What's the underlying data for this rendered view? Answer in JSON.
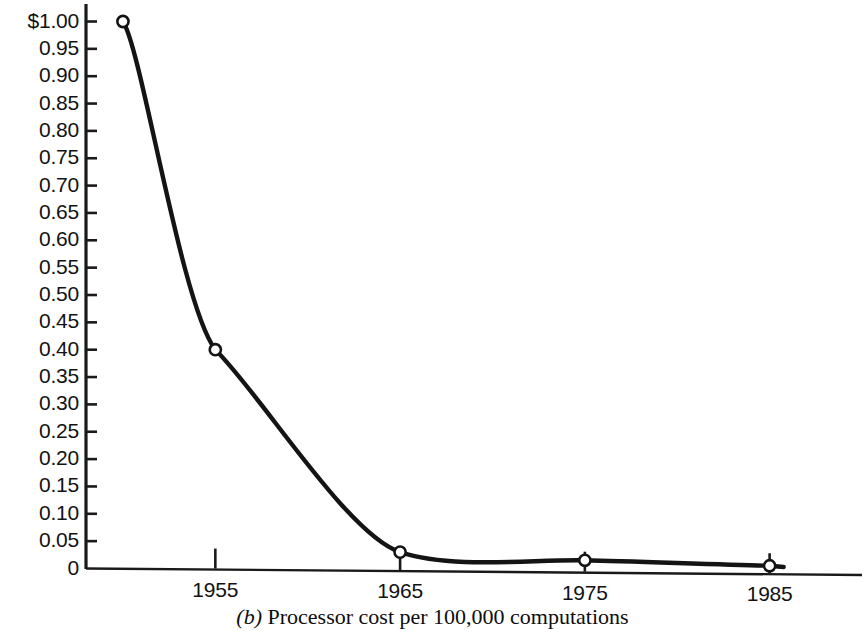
{
  "caption": {
    "letter": "(b)",
    "text": "Processor cost per 100,000 computations",
    "full": "(b) Processor cost per 100,000 computations"
  },
  "colors": {
    "line": "#141414",
    "axis": "#1a1a1a",
    "marker_fill": "#ffffff",
    "marker_stroke": "#141414",
    "background": "#ffffff",
    "text": "#121212"
  },
  "chart_data": {
    "type": "line",
    "title": "",
    "subtitle": "",
    "xlabel": "",
    "ylabel": "",
    "x": [
      1950,
      1955,
      1965,
      1975,
      1985
    ],
    "values": [
      1.0,
      0.4,
      0.03,
      0.015,
      0.005
    ],
    "series": [
      {
        "name": "Processor cost per 100,000 computations",
        "values": [
          1.0,
          0.4,
          0.03,
          0.015,
          0.005
        ]
      }
    ],
    "xlim": [
      1948,
      1990
    ],
    "ylim": [
      0,
      1.0
    ],
    "grid": false,
    "legend": false,
    "legend_position": "none",
    "marker": "open-circle",
    "x_tick_labels": [
      "1955",
      "1965",
      "1975",
      "1985"
    ],
    "x_tick_values": [
      1955,
      1965,
      1975,
      1985
    ],
    "y_tick_labels": [
      "$1.00",
      "0.95",
      "0.90",
      "0.85",
      "0.80",
      "0.75",
      "0.70",
      "0.65",
      "0.60",
      "0.55",
      "0.50",
      "0.45",
      "0.40",
      "0.35",
      "0.30",
      "0.25",
      "0.20",
      "0.15",
      "0.10",
      "0.05",
      "0"
    ],
    "y_tick_values": [
      1.0,
      0.95,
      0.9,
      0.85,
      0.8,
      0.75,
      0.7,
      0.65,
      0.6,
      0.55,
      0.5,
      0.45,
      0.4,
      0.35,
      0.3,
      0.25,
      0.2,
      0.15,
      0.1,
      0.05,
      0
    ],
    "annotations": []
  }
}
